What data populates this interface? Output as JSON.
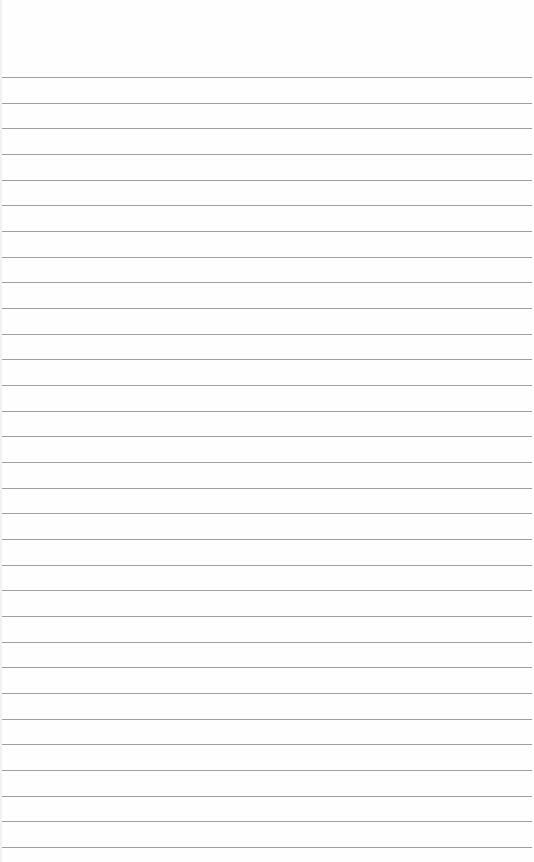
{
  "paper": {
    "type": "lined-notebook-paper",
    "background_color": "#fefefe",
    "line_color": "#8f8f8f",
    "line_count": 31,
    "first_line_y": 77,
    "line_spacing": 25.67
  }
}
